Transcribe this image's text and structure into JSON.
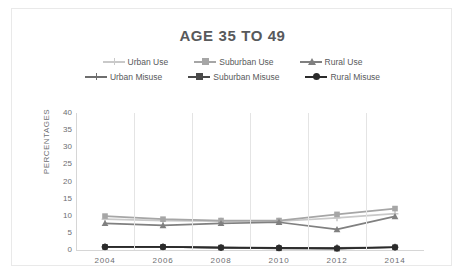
{
  "figure": {
    "title": "AGE 35 TO 49",
    "title_color": "#58595b",
    "background": "#ffffff",
    "border_color": "#e9e9e9"
  },
  "legend": {
    "position": "top",
    "rows": [
      [
        {
          "label": "Urban Use",
          "color": "#c9c9c9",
          "marker": "plus"
        },
        {
          "label": "Suburban Use",
          "color": "#a6a6a6",
          "marker": "square"
        },
        {
          "label": "Rural Use",
          "color": "#808080",
          "marker": "triangle"
        }
      ],
      [
        {
          "label": "Urban Misuse",
          "color": "#6e6e6e",
          "marker": "plus"
        },
        {
          "label": "Suburban Misuse",
          "color": "#4a4a4a",
          "marker": "square"
        },
        {
          "label": "Rural Misuse",
          "color": "#2b2b2b",
          "marker": "circle"
        }
      ]
    ]
  },
  "axes": {
    "y_title": "PERCENTAGES",
    "y_ticks": [
      "40",
      "35",
      "30",
      "25",
      "20",
      "15",
      "10",
      "5",
      "0"
    ],
    "x_ticks": [
      "2004",
      "2006",
      "2008",
      "2010",
      "2012",
      "2014"
    ],
    "tick_color": "#6d6e71",
    "gridline_color": "#e4e4e4",
    "axis_line_color": "#d6d6d6"
  },
  "chart_data": {
    "type": "line",
    "title": "AGE 35 TO 49",
    "xlabel": "",
    "ylabel": "PERCENTAGES",
    "categories": [
      2004,
      2006,
      2008,
      2010,
      2012,
      2014
    ],
    "ylim": [
      0,
      40
    ],
    "ytick_step": 5,
    "grid": "vertical",
    "legend_position": "top",
    "series": [
      {
        "name": "Urban Use",
        "color": "#c9c9c9",
        "marker": "plus",
        "values": [
          9.0,
          8.6,
          8.4,
          8.4,
          9.4,
          10.6
        ]
      },
      {
        "name": "Suburban Use",
        "color": "#a6a6a6",
        "marker": "square",
        "values": [
          9.9,
          9.0,
          8.6,
          8.6,
          10.4,
          12.1
        ]
      },
      {
        "name": "Rural Use",
        "color": "#808080",
        "marker": "triangle",
        "values": [
          7.8,
          7.2,
          7.8,
          8.1,
          6.0,
          9.8
        ]
      },
      {
        "name": "Urban Misuse",
        "color": "#6e6e6e",
        "marker": "plus",
        "values": [
          0.9,
          0.9,
          0.7,
          0.6,
          0.6,
          0.8
        ]
      },
      {
        "name": "Suburban Misuse",
        "color": "#4a4a4a",
        "marker": "square",
        "values": [
          0.9,
          0.9,
          0.7,
          0.5,
          0.4,
          0.8
        ]
      },
      {
        "name": "Rural Misuse",
        "color": "#2b2b2b",
        "marker": "circle",
        "values": [
          0.9,
          0.9,
          0.7,
          0.6,
          0.5,
          0.8
        ]
      }
    ]
  }
}
